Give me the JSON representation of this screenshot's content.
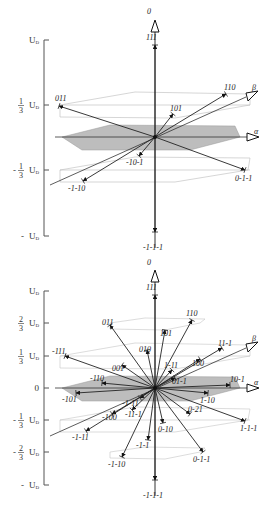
{
  "figure": {
    "top_diagram": {
      "y_axis": {
        "ticks": [
          {
            "label": "U",
            "sub": "D",
            "sign": "",
            "frac": "",
            "y": 40
          },
          {
            "label": "U",
            "sub": "D",
            "sign": "",
            "frac": "1/3",
            "y": 105
          },
          {
            "label": "U",
            "sub": "D",
            "sign": "-",
            "frac": "1/3",
            "y": 170
          },
          {
            "label": "U",
            "sub": "D",
            "sign": "- ",
            "frac": "",
            "y": 236
          }
        ]
      },
      "axes": {
        "zero": "0",
        "alpha": "α",
        "beta": "β"
      },
      "vectors": [
        {
          "label": "111",
          "tip": [
            155,
            45
          ],
          "lx": 146,
          "ly": 40
        },
        {
          "label": "-1-1-1",
          "tip": [
            155,
            232
          ],
          "lx": 143,
          "ly": 250
        },
        {
          "label": "011",
          "tip": [
            59,
            106
          ],
          "lx": 55,
          "ly": 101
        },
        {
          "label": "110",
          "tip": [
            226,
            94
          ],
          "lx": 224,
          "ly": 90
        },
        {
          "label": "101",
          "tip": [
            173,
            114
          ],
          "lx": 170,
          "ly": 111
        },
        {
          "label": "-10-1",
          "tip": [
            139,
            156
          ],
          "lx": 126,
          "ly": 165
        },
        {
          "label": "-1-10",
          "tip": [
            83,
            181
          ],
          "lx": 68,
          "ly": 191
        },
        {
          "label": "0-1-1",
          "tip": [
            245,
            170
          ],
          "lx": 235,
          "ly": 181
        }
      ]
    },
    "bottom_diagram": {
      "y_axis": {
        "ticks": [
          {
            "label": "U",
            "sub": "D",
            "sign": "",
            "frac": "",
            "y": 291
          },
          {
            "label": "U",
            "sub": "D",
            "sign": "",
            "frac": "2/3",
            "y": 323
          },
          {
            "label": "U",
            "sub": "D",
            "sign": "",
            "frac": "1/3",
            "y": 356
          },
          {
            "label": "0",
            "sub": "",
            "sign": "",
            "frac": "",
            "y": 388
          },
          {
            "label": "U",
            "sub": "D",
            "sign": "-",
            "frac": "1/3",
            "y": 420
          },
          {
            "label": "U",
            "sub": "D",
            "sign": "-",
            "frac": "2/3",
            "y": 452
          },
          {
            "label": "U",
            "sub": "D",
            "sign": "- ",
            "frac": "",
            "y": 485
          }
        ]
      },
      "axes": {
        "zero": "0",
        "alpha": "α",
        "beta": "β"
      },
      "vectors": [
        {
          "label": "111",
          "tip": [
            155,
            295
          ],
          "lx": 146,
          "ly": 290
        },
        {
          "label": "-1-1-1",
          "tip": [
            155,
            480
          ],
          "lx": 143,
          "ly": 498
        },
        {
          "label": "011",
          "tip": [
            110,
            325
          ],
          "lx": 102,
          "ly": 325
        },
        {
          "label": "110",
          "tip": [
            192,
            320
          ],
          "lx": 186,
          "ly": 316
        },
        {
          "label": "101",
          "tip": [
            165,
            330
          ],
          "lx": 160,
          "ly": 336
        },
        {
          "label": "-111",
          "tip": [
            65,
            356
          ],
          "lx": 52,
          "ly": 354
        },
        {
          "label": "11-1",
          "tip": [
            222,
            348
          ],
          "lx": 218,
          "ly": 346
        },
        {
          "label": "010",
          "tip": [
            147,
            350
          ],
          "lx": 139,
          "ly": 352
        },
        {
          "label": "001",
          "tip": [
            122,
            365
          ],
          "lx": 112,
          "ly": 371
        },
        {
          "label": "100",
          "tip": [
            200,
            359
          ],
          "lx": 192,
          "ly": 366
        },
        {
          "label": "1-11",
          "tip": [
            172,
            370
          ],
          "lx": 164,
          "ly": 368
        },
        {
          "label": "01-1",
          "tip": [
            175,
            378
          ],
          "lx": 172,
          "ly": 384
        },
        {
          "label": "-110",
          "tip": [
            102,
            383
          ],
          "lx": 90,
          "ly": 381
        },
        {
          "label": "10-1",
          "tip": [
            230,
            385
          ],
          "lx": 230,
          "ly": 382
        },
        {
          "label": "-101",
          "tip": [
            76,
            393
          ],
          "lx": 62,
          "ly": 402
        },
        {
          "label": "1-10",
          "tip": [
            208,
            393
          ],
          "lx": 200,
          "ly": 403
        },
        {
          "label": "-1-11",
          "tip": [
            140,
            398
          ],
          "lx": 122,
          "ly": 406
        },
        {
          "label": "-100",
          "tip": [
            112,
            414
          ],
          "lx": 102,
          "ly": 420
        },
        {
          "label": "-11-1",
          "tip": [
            132,
            410
          ],
          "lx": 125,
          "ly": 417
        },
        {
          "label": "0-21",
          "tip": [
            190,
            414
          ],
          "lx": 188,
          "ly": 412
        },
        {
          "label": "-1-11",
          "tip": [
            86,
            431
          ],
          "lx": 72,
          "ly": 440
        },
        {
          "label": "1-1-1",
          "tip": [
            245,
            421
          ],
          "lx": 240,
          "ly": 431
        },
        {
          "label": "0-10",
          "tip": [
            163,
            423
          ],
          "lx": 158,
          "ly": 432
        },
        {
          "label": "-1-1",
          "tip": [
            148,
            440
          ],
          "lx": 136,
          "ly": 448
        },
        {
          "label": "-1-10",
          "tip": [
            122,
            457
          ],
          "lx": 108,
          "ly": 467
        },
        {
          "label": "0-1-1",
          "tip": [
            203,
            452
          ],
          "lx": 193,
          "ly": 462
        }
      ]
    }
  }
}
